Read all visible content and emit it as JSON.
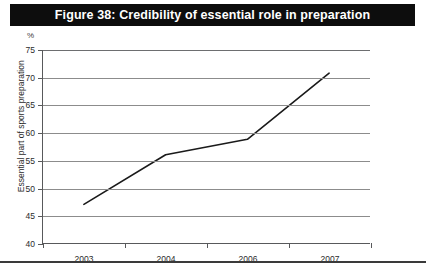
{
  "title_bar": {
    "text": "Figure 38: Credibility of essential role in preparation",
    "background": "#0d0d0d",
    "text_color": "#ffffff"
  },
  "chart_data": {
    "type": "line",
    "title": "Figure 38: Credibility of essential role in preparation",
    "xlabel": "",
    "ylabel": "Essential part of sports preparation",
    "unit_label": "%",
    "categories": [
      "2003",
      "2004",
      "2006",
      "2007"
    ],
    "values": [
      47,
      56,
      58.8,
      70.8
    ],
    "series": [
      {
        "name": "Essential part of sports preparation",
        "values": [
          47,
          56,
          58.8,
          70.8
        ]
      }
    ],
    "ylim": [
      40,
      75
    ],
    "yticks": [
      40,
      45,
      50,
      55,
      60,
      65,
      70,
      75
    ],
    "ytick_labels": [
      "40",
      "45",
      "50",
      "55",
      "60",
      "65",
      "70",
      "75"
    ],
    "grid": true,
    "grid_axis": "y",
    "legend": false,
    "legend_position": "none",
    "line_color": "#1a1a1a",
    "grid_color": "#8c8c8c",
    "axis_color": "#58595b",
    "markers": false
  },
  "bottom_rule": {
    "color": "#3a3a3a"
  }
}
